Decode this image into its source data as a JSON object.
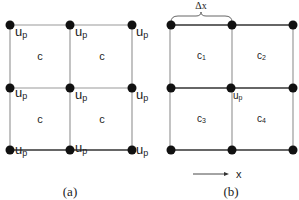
{
  "panel_a": {
    "caption": "(a)",
    "cell_labels": [
      "c",
      "c",
      "c",
      "c"
    ],
    "node_label": "u",
    "node_label_sub": "p"
  },
  "panel_b": {
    "caption": "(b)",
    "spacing_label": "Δx",
    "cell_labels": [
      {
        "main": "c",
        "sub": "1"
      },
      {
        "main": "c",
        "sub": "2"
      },
      {
        "main": "c",
        "sub": "3"
      },
      {
        "main": "c",
        "sub": "4"
      }
    ],
    "center_node_label": "u",
    "center_node_sub": "p",
    "axis_label": "x"
  }
}
